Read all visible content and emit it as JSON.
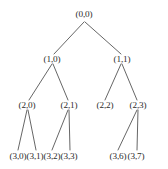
{
  "figure": {
    "width": 168,
    "height": 169,
    "background_color": "#ffffff",
    "edge_color": "#555555",
    "label_color": "#2b2b2b"
  },
  "chart_data": {
    "type": "diagram",
    "subtype": "tree",
    "title": "",
    "nodes": [
      {
        "id": "n00",
        "label": "(0,0)",
        "level": 0,
        "x": 84,
        "y": 15
      },
      {
        "id": "n10",
        "label": "(1,0)",
        "level": 1,
        "x": 52,
        "y": 60
      },
      {
        "id": "n11",
        "label": "(1,1)",
        "level": 1,
        "x": 122,
        "y": 60
      },
      {
        "id": "n20",
        "label": "(2,0)",
        "level": 2,
        "x": 27,
        "y": 106
      },
      {
        "id": "n21",
        "label": "(2,1)",
        "level": 2,
        "x": 69,
        "y": 106
      },
      {
        "id": "n22",
        "label": "(2,2)",
        "level": 2,
        "x": 105,
        "y": 106
      },
      {
        "id": "n23",
        "label": "(2,3)",
        "level": 2,
        "x": 138,
        "y": 106
      },
      {
        "id": "n30",
        "label": "(3,0)",
        "level": 3,
        "x": 18,
        "y": 157
      },
      {
        "id": "n31",
        "label": "(3,1)",
        "level": 3,
        "x": 35,
        "y": 157
      },
      {
        "id": "n32",
        "label": "(3,2)",
        "level": 3,
        "x": 52,
        "y": 157
      },
      {
        "id": "n33",
        "label": "(3,3)",
        "level": 3,
        "x": 69,
        "y": 157
      },
      {
        "id": "n36",
        "label": "(3,6)",
        "level": 3,
        "x": 118,
        "y": 157
      },
      {
        "id": "n37",
        "label": "(3,7)",
        "level": 3,
        "x": 136,
        "y": 157
      }
    ],
    "edges": [
      {
        "from": "n00",
        "to": "n10",
        "x1": 84,
        "y1": 22,
        "x2": 54,
        "y2": 54
      },
      {
        "from": "n00",
        "to": "n11",
        "x1": 85,
        "y1": 22,
        "x2": 121,
        "y2": 54
      },
      {
        "from": "n10",
        "to": "n20",
        "x1": 52,
        "y1": 64,
        "x2": 29,
        "y2": 100
      },
      {
        "from": "n10",
        "to": "n21",
        "x1": 53,
        "y1": 64,
        "x2": 68,
        "y2": 100
      },
      {
        "from": "n11",
        "to": "n22",
        "x1": 121,
        "y1": 64,
        "x2": 105,
        "y2": 100
      },
      {
        "from": "n11",
        "to": "n23",
        "x1": 122,
        "y1": 64,
        "x2": 137,
        "y2": 100
      },
      {
        "from": "n20",
        "to": "n30",
        "x1": 27,
        "y1": 110,
        "x2": 18,
        "y2": 150
      },
      {
        "from": "n20",
        "to": "n31",
        "x1": 28,
        "y1": 110,
        "x2": 36,
        "y2": 150
      },
      {
        "from": "n21",
        "to": "n32",
        "x1": 68,
        "y1": 110,
        "x2": 52,
        "y2": 150
      },
      {
        "from": "n21",
        "to": "n33",
        "x1": 69,
        "y1": 110,
        "x2": 70,
        "y2": 150
      },
      {
        "from": "n23",
        "to": "n36",
        "x1": 137,
        "y1": 110,
        "x2": 118,
        "y2": 150
      },
      {
        "from": "n23",
        "to": "n37",
        "x1": 138,
        "y1": 110,
        "x2": 137,
        "y2": 150
      }
    ],
    "leaf_nodes": [
      "n22",
      "n30",
      "n31",
      "n32",
      "n33",
      "n36",
      "n37"
    ],
    "levels": 4
  }
}
